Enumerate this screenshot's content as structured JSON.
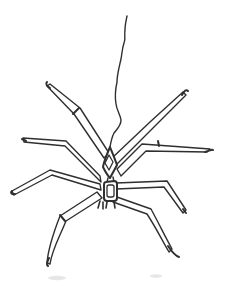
{
  "illustration": {
    "title": "Ink line drawing of a spider hanging upside-down from a single wavy silk thread",
    "ink_color": "#2f2f2f",
    "paper_color": "#ffffff",
    "smudge_color": "#c9c9c9",
    "parts": {
      "thread_label": "silk thread",
      "abdomen_label": "diamond-shaped abdomen with inner diamond marking",
      "cephalothorax_label": "rectangular cephalothorax with inner panel",
      "fangs_label": "fangs",
      "left_leg_count": 4,
      "right_leg_count": 4
    }
  }
}
